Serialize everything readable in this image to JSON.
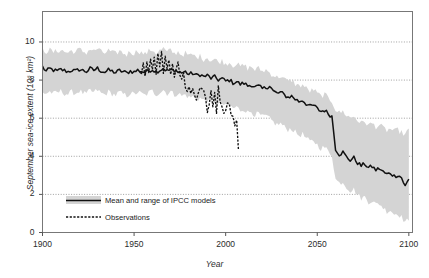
{
  "chart_data": {
    "type": "line",
    "title": "",
    "xlabel": "Year",
    "ylabel": "September sea-ice extent (10⁶ km²)",
    "xlim": [
      1900,
      2102
    ],
    "ylim": [
      0,
      11.6
    ],
    "xticks": [
      1900,
      1950,
      2000,
      2050,
      2100
    ],
    "yticks": [
      0,
      2,
      4,
      6,
      8,
      10
    ],
    "grid": "horizontal-dotted",
    "legend_position": "bottom-left-inside",
    "colors": {
      "band": "#d4d4d4",
      "mean_line": "#111111",
      "observations": "#111111",
      "frame": "#777777",
      "grid": "#888888"
    },
    "series": [
      {
        "name": "Mean and range of IPCC models",
        "style": "solid-line-with-shaded-range",
        "x": [
          1900,
          1902,
          1904,
          1906,
          1908,
          1910,
          1912,
          1914,
          1916,
          1918,
          1920,
          1922,
          1924,
          1926,
          1928,
          1930,
          1932,
          1934,
          1936,
          1938,
          1940,
          1942,
          1944,
          1946,
          1948,
          1950,
          1952,
          1954,
          1956,
          1958,
          1960,
          1962,
          1964,
          1966,
          1968,
          1970,
          1972,
          1974,
          1976,
          1978,
          1980,
          1982,
          1984,
          1986,
          1988,
          1990,
          1992,
          1994,
          1996,
          1998,
          2000,
          2002,
          2004,
          2006,
          2008,
          2010,
          2012,
          2014,
          2016,
          2018,
          2020,
          2022,
          2024,
          2026,
          2028,
          2030,
          2032,
          2034,
          2036,
          2038,
          2040,
          2042,
          2044,
          2046,
          2048,
          2050,
          2052,
          2054,
          2056,
          2058,
          2060,
          2062,
          2064,
          2066,
          2068,
          2070,
          2072,
          2074,
          2076,
          2078,
          2080,
          2082,
          2084,
          2086,
          2088,
          2090,
          2092,
          2094,
          2096,
          2098,
          2100
        ],
        "mean": [
          8.7,
          8.45,
          8.6,
          8.52,
          8.46,
          8.55,
          8.5,
          8.44,
          8.52,
          8.47,
          8.56,
          8.5,
          8.45,
          8.6,
          8.52,
          8.62,
          8.48,
          8.42,
          8.52,
          8.46,
          8.4,
          8.5,
          8.44,
          8.38,
          8.48,
          8.42,
          8.52,
          8.46,
          8.4,
          8.5,
          8.56,
          8.44,
          8.52,
          8.62,
          8.48,
          8.55,
          8.42,
          8.5,
          8.38,
          8.44,
          8.3,
          8.36,
          8.24,
          8.3,
          8.18,
          8.24,
          8.1,
          8.16,
          8.02,
          8.08,
          7.94,
          8.0,
          7.86,
          7.92,
          7.78,
          7.84,
          7.7,
          7.76,
          7.62,
          7.68,
          7.54,
          7.6,
          7.72,
          7.42,
          7.3,
          7.36,
          7.22,
          7.1,
          7.16,
          7.0,
          6.88,
          6.94,
          6.76,
          6.62,
          6.68,
          6.5,
          6.36,
          6.42,
          6.24,
          6.1,
          6.16,
          5.92,
          6.0,
          5.78,
          5.62,
          5.68,
          5.5,
          5.32,
          5.38,
          5.2,
          5.06,
          5.12,
          4.94,
          4.8,
          4.86,
          4.68,
          4.54,
          4.6,
          4.42,
          4.3,
          4.36
        ],
        "mean_tail_x": [
          2060,
          2062,
          2064,
          2066,
          2068,
          2070,
          2072,
          2074,
          2076,
          2078,
          2080,
          2082,
          2084,
          2086,
          2088,
          2090,
          2092,
          2094,
          2096,
          2098,
          2100
        ],
        "mean_tail": [
          4.4,
          4.1,
          4.22,
          3.95,
          3.8,
          3.92,
          3.66,
          3.5,
          3.6,
          3.4,
          3.46,
          3.28,
          3.36,
          3.18,
          3.05,
          3.12,
          2.96,
          3.02,
          2.88,
          2.42,
          2.8
        ],
        "lower": [
          7.35,
          7.3,
          7.4,
          7.28,
          7.34,
          7.42,
          7.3,
          7.26,
          7.38,
          7.3,
          7.44,
          7.32,
          7.26,
          7.46,
          7.34,
          7.48,
          7.3,
          7.24,
          7.38,
          7.28,
          7.22,
          7.36,
          7.26,
          7.18,
          7.32,
          7.24,
          7.38,
          7.28,
          7.2,
          7.34,
          7.42,
          7.26,
          7.36,
          7.48,
          7.3,
          7.4,
          7.22,
          7.32,
          7.16,
          7.24,
          7.08,
          7.14,
          7.0,
          7.06,
          6.92,
          6.98,
          6.82,
          6.88,
          6.72,
          6.78,
          6.62,
          6.68,
          6.52,
          6.58,
          6.42,
          6.48,
          6.3,
          6.36,
          6.18,
          6.24,
          6.06,
          6.12,
          5.96,
          5.8,
          5.66,
          5.72,
          5.54,
          5.4,
          5.46,
          5.26,
          5.1,
          5.16,
          4.94,
          4.76,
          4.82,
          4.6,
          4.42,
          4.48,
          4.26,
          4.08,
          4.14,
          3.88,
          3.94,
          3.7,
          3.5,
          3.56,
          3.34,
          3.12,
          3.18,
          2.96,
          2.78,
          2.84,
          2.62,
          2.44,
          2.5,
          2.28,
          2.1,
          2.16,
          1.94,
          1.76,
          1.82
        ],
        "lower_tail": [
          2.8,
          2.6,
          2.66,
          2.4,
          2.2,
          2.26,
          2.0,
          1.8,
          1.86,
          1.62,
          1.68,
          1.46,
          1.52,
          1.3,
          1.12,
          1.18,
          0.96,
          1.02,
          0.8,
          0.58,
          0.62
        ],
        "upper": [
          9.62,
          9.5,
          9.58,
          9.46,
          9.52,
          9.6,
          9.48,
          9.44,
          9.56,
          9.46,
          9.62,
          9.5,
          9.44,
          9.64,
          9.52,
          9.66,
          9.48,
          9.42,
          9.56,
          9.44,
          9.38,
          9.54,
          9.42,
          9.34,
          9.5,
          9.4,
          9.56,
          9.44,
          9.36,
          9.52,
          9.6,
          9.42,
          9.54,
          9.66,
          9.46,
          9.58,
          9.38,
          9.5,
          9.32,
          9.42,
          9.26,
          9.34,
          9.18,
          9.26,
          9.1,
          9.18,
          9.02,
          9.1,
          8.94,
          9.02,
          8.86,
          8.94,
          8.78,
          8.86,
          8.7,
          8.78,
          8.62,
          8.7,
          8.54,
          8.62,
          8.46,
          8.54,
          8.38,
          8.26,
          8.14,
          8.22,
          8.04,
          7.92,
          8.0,
          7.8,
          7.68,
          7.76,
          7.56,
          7.42,
          7.5,
          7.3,
          7.16,
          7.24,
          7.04,
          6.9,
          6.98,
          6.74,
          6.82,
          6.6,
          6.44,
          6.52,
          6.32,
          6.14,
          6.22,
          6.02,
          5.88,
          5.96,
          5.76,
          5.62,
          5.7,
          5.52,
          5.38,
          5.46,
          5.28,
          5.14,
          5.22
        ],
        "upper_tail": [
          6.45,
          6.28,
          6.36,
          6.16,
          6.02,
          6.1,
          5.9,
          5.74,
          5.82,
          5.64,
          5.72,
          5.56,
          5.64,
          5.48,
          5.36,
          5.44,
          5.3,
          5.38,
          5.24,
          5.14,
          5.46
        ]
      },
      {
        "name": "Observations",
        "style": "dashed-line",
        "x": [
          1953,
          1954,
          1955,
          1956,
          1957,
          1958,
          1959,
          1960,
          1961,
          1962,
          1963,
          1964,
          1965,
          1966,
          1967,
          1968,
          1969,
          1970,
          1971,
          1972,
          1973,
          1974,
          1975,
          1976,
          1977,
          1978,
          1979,
          1980,
          1981,
          1982,
          1983,
          1984,
          1985,
          1986,
          1987,
          1988,
          1989,
          1990,
          1991,
          1992,
          1993,
          1994,
          1995,
          1996,
          1997,
          1998,
          1999,
          2000,
          2001,
          2002,
          2003,
          2004,
          2005,
          2006,
          2007
        ],
        "y": [
          8.45,
          8.3,
          8.9,
          8.2,
          8.95,
          8.4,
          9.1,
          8.55,
          9.2,
          8.3,
          9.4,
          8.7,
          9.5,
          8.35,
          9.25,
          8.6,
          9.05,
          8.3,
          8.85,
          8.15,
          8.6,
          8.95,
          8.25,
          8.05,
          8.4,
          7.6,
          7.4,
          7.65,
          7.3,
          7.55,
          7.2,
          6.95,
          7.3,
          7.6,
          7.55,
          7.45,
          7.1,
          6.3,
          6.7,
          7.45,
          6.6,
          7.35,
          6.25,
          7.7,
          6.85,
          6.6,
          6.25,
          6.4,
          6.8,
          6.75,
          6.15,
          6.1,
          5.6,
          5.9,
          4.3
        ]
      }
    ],
    "legend": [
      {
        "label": "Mean and range of IPCC models",
        "marker": "band-with-line"
      },
      {
        "label": "Observations",
        "marker": "dashed-line"
      }
    ]
  }
}
